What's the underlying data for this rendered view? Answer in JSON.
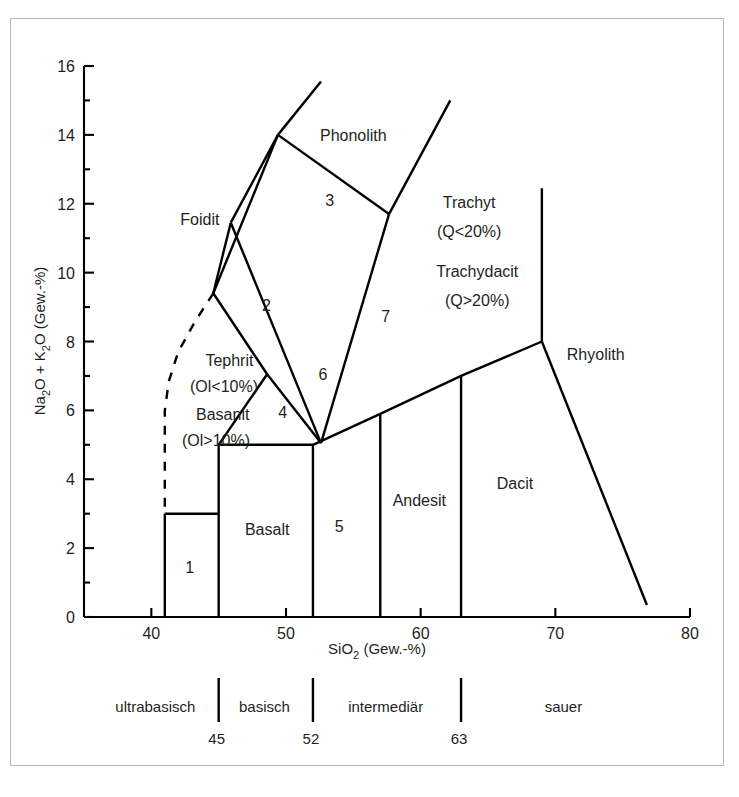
{
  "chart_data": {
    "type": "scatter",
    "title": "",
    "xlabel": "SiO2 (Gew.-%)",
    "ylabel": "Na2O + K2O (Gew.-%)",
    "xlabel_rich": {
      "pre": "SiO",
      "sub": "2",
      "post": " (Gew.-%)"
    },
    "ylabel_rich": {
      "a": "Na",
      "a_sub": "2",
      "b": "O + K",
      "b_sub": "2",
      "c": "O (Gew.-%)"
    },
    "xlim": [
      35,
      80
    ],
    "ylim": [
      0,
      16
    ],
    "xticks": [
      40,
      50,
      60,
      70,
      80
    ],
    "xtick_labels": [
      "40",
      "50",
      "60",
      "70",
      "80"
    ],
    "yticks": [
      0,
      2,
      4,
      6,
      8,
      10,
      12,
      14,
      16
    ],
    "ytick_labels": [
      "0",
      "2",
      "4",
      "6",
      "8",
      "10",
      "12",
      "14",
      "16"
    ],
    "y_minor_step": 1,
    "grid": false,
    "legend": "none",
    "field_labels": [
      {
        "text": "Foidit",
        "x": 43.6,
        "y": 11.55,
        "anchor": "middle"
      },
      {
        "text": "Phonolith",
        "x": 55.0,
        "y": 14.0,
        "anchor": "middle"
      },
      {
        "text": "Trachyt",
        "x": 63.6,
        "y": 12.05,
        "anchor": "middle"
      },
      {
        "text": "(Q<20%)",
        "x": 63.6,
        "y": 11.2,
        "anchor": "middle"
      },
      {
        "text": "Trachydacit",
        "x": 64.2,
        "y": 10.05,
        "anchor": "middle"
      },
      {
        "text": "(Q>20%)",
        "x": 64.2,
        "y": 9.2,
        "anchor": "middle"
      },
      {
        "text": "Rhyolith",
        "x": 73.0,
        "y": 7.65,
        "anchor": "middle"
      },
      {
        "text": "Tephrit",
        "x": 45.8,
        "y": 7.45,
        "anchor": "middle"
      },
      {
        "text": "(Ol<10%)",
        "x": 45.4,
        "y": 6.7,
        "anchor": "middle"
      },
      {
        "text": "Basanit",
        "x": 45.3,
        "y": 5.9,
        "anchor": "middle"
      },
      {
        "text": "(Ol>10%)",
        "x": 44.8,
        "y": 5.15,
        "anchor": "middle"
      },
      {
        "text": "Basalt",
        "x": 48.6,
        "y": 2.55,
        "anchor": "middle"
      },
      {
        "text": "Andesit",
        "x": 59.9,
        "y": 3.4,
        "anchor": "middle"
      },
      {
        "text": "Dacit",
        "x": 67.0,
        "y": 3.9,
        "anchor": "middle"
      }
    ],
    "numbered_fields": [
      {
        "label": "1",
        "x": 42.85,
        "y": 1.45
      },
      {
        "label": "2",
        "x": 48.55,
        "y": 9.05
      },
      {
        "label": "3",
        "x": 53.25,
        "y": 12.1
      },
      {
        "label": "4",
        "x": 49.75,
        "y": 5.95
      },
      {
        "label": "5",
        "x": 53.95,
        "y": 2.65
      },
      {
        "label": "6",
        "x": 52.75,
        "y": 7.05
      },
      {
        "label": "7",
        "x": 57.4,
        "y": 8.75
      }
    ],
    "boundaries": [
      {
        "name": "foidit-right-lower",
        "points": [
          [
            44.6,
            9.4
          ],
          [
            49.4,
            14.0
          ]
        ]
      },
      {
        "name": "phonolith-left-up",
        "points": [
          [
            49.4,
            14.0
          ],
          [
            52.6,
            15.55
          ]
        ]
      },
      {
        "name": "phonolith-right-up",
        "points": [
          [
            57.65,
            11.7
          ],
          [
            62.2,
            15.0
          ]
        ]
      },
      {
        "name": "field3-bottom-right",
        "points": [
          [
            49.4,
            14.0
          ],
          [
            57.65,
            11.7
          ]
        ]
      },
      {
        "name": "field3-left",
        "points": [
          [
            49.4,
            14.0
          ],
          [
            45.9,
            11.45
          ]
        ]
      },
      {
        "name": "field2-bottom-left",
        "points": [
          [
            45.9,
            11.45
          ],
          [
            44.6,
            9.4
          ]
        ]
      },
      {
        "name": "field2-3-divider",
        "points": [
          [
            45.9,
            11.45
          ],
          [
            52.6,
            5.05
          ]
        ]
      },
      {
        "name": "trachyt-left",
        "points": [
          [
            57.65,
            11.7
          ],
          [
            52.6,
            5.05
          ]
        ]
      },
      {
        "name": "foid-tephrit-left",
        "points": [
          [
            44.6,
            9.4
          ],
          [
            48.6,
            7.05
          ]
        ]
      },
      {
        "name": "tephrit-base-right",
        "points": [
          [
            48.6,
            7.05
          ],
          [
            52.6,
            5.05
          ]
        ]
      },
      {
        "name": "basanit-to-basalt",
        "points": [
          [
            48.6,
            7.05
          ],
          [
            45.0,
            5.0
          ]
        ]
      },
      {
        "name": "basalt-top",
        "points": [
          [
            45.0,
            5.0
          ],
          [
            52.0,
            5.0
          ]
        ]
      },
      {
        "name": "basalt-left-vert",
        "points": [
          [
            45.0,
            5.0
          ],
          [
            45.0,
            0.0
          ]
        ]
      },
      {
        "name": "basalt-right-vert",
        "points": [
          [
            52.0,
            5.0
          ],
          [
            52.0,
            0.0
          ]
        ]
      },
      {
        "name": "field1-top",
        "points": [
          [
            41.0,
            3.0
          ],
          [
            45.0,
            3.0
          ]
        ]
      },
      {
        "name": "field1-left-vert",
        "points": [
          [
            41.0,
            3.0
          ],
          [
            41.0,
            0.0
          ]
        ]
      },
      {
        "name": "trachy-andesite-base",
        "points": [
          [
            52.0,
            5.0
          ],
          [
            57.0,
            5.9
          ],
          [
            63.0,
            7.0
          ],
          [
            69.0,
            8.0
          ]
        ]
      },
      {
        "name": "field5-right-vert",
        "points": [
          [
            57.0,
            5.9
          ],
          [
            57.0,
            0.0
          ]
        ]
      },
      {
        "name": "andesit-right-vert",
        "points": [
          [
            63.0,
            7.0
          ],
          [
            63.0,
            0.0
          ]
        ]
      },
      {
        "name": "trachydacit-right",
        "points": [
          [
            69.0,
            8.0
          ],
          [
            69.0,
            12.45
          ]
        ]
      },
      {
        "name": "dacit-rhyolith",
        "points": [
          [
            69.0,
            8.0
          ],
          [
            76.8,
            0.35
          ]
        ]
      }
    ],
    "dashed_boundary": {
      "name": "foidit-basanit-dashed",
      "points": [
        [
          44.6,
          9.4
        ],
        [
          43.2,
          8.55
        ],
        [
          42.0,
          7.7
        ],
        [
          41.3,
          6.85
        ],
        [
          41.0,
          6.0
        ],
        [
          41.0,
          3.0
        ]
      ]
    }
  },
  "classification_bar": {
    "segments": [
      {
        "label": "ultrabasisch",
        "x": 40.3
      },
      {
        "label": "basisch",
        "x": 48.4
      },
      {
        "label": "intermediär",
        "x": 57.4
      },
      {
        "label": "sauer",
        "x": 70.6
      }
    ],
    "dividers": [
      {
        "value": 45,
        "label": "45"
      },
      {
        "value": 52,
        "label": "52"
      },
      {
        "value": 63,
        "label": "63"
      }
    ]
  }
}
